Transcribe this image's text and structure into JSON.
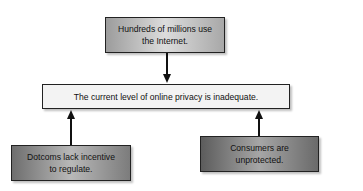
{
  "diagram": {
    "type": "argument-map",
    "nodes": {
      "top": {
        "label": "Hundreds of millions use the Internet.",
        "line1": "Hundreds of millions use",
        "line2": "the Internet."
      },
      "center": {
        "label": "The current level of online privacy is inadequate."
      },
      "left": {
        "label": "Dotcoms lack incentive to regulate.",
        "line1": "Dotcoms lack incentive",
        "line2": "to regulate."
      },
      "right": {
        "label": "Consumers are unprotected.",
        "line1": "Consumers are",
        "line2": "unprotected."
      }
    },
    "edges": [
      {
        "from": "top",
        "to": "center"
      },
      {
        "from": "left",
        "to": "center"
      },
      {
        "from": "right",
        "to": "center"
      }
    ]
  }
}
